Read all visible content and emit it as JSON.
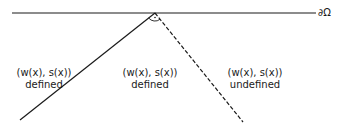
{
  "diagram": {
    "boundary": {
      "label": "∂Ω",
      "x1": 12,
      "y1": 13,
      "x2": 316,
      "y2": 13
    },
    "apex": {
      "x": 155,
      "y": 13
    },
    "solid_line": {
      "x1": 155,
      "y1": 13,
      "x2": 20,
      "y2": 120,
      "style": "solid"
    },
    "dashed_line": {
      "x1": 155,
      "y1": 13,
      "x2": 243,
      "y2": 122,
      "style": "dashed"
    },
    "angle_marker": {
      "type": "arc-with-dot"
    },
    "regions": [
      {
        "id": "left",
        "line1": "(w(x), s(x))",
        "line2": "defined"
      },
      {
        "id": "middle",
        "line1": "(w(x), s(x))",
        "line2": "defined"
      },
      {
        "id": "right",
        "line1": "(w(x), s(x))",
        "line2": "undefined"
      }
    ],
    "colors": {
      "stroke": "#1a1a1a",
      "background": "#ffffff"
    }
  }
}
